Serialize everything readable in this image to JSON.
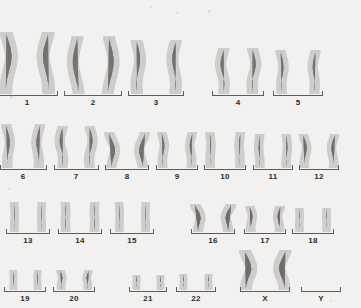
{
  "figure": {
    "kind": "human-karyotype",
    "background_color": "#f2f1ef",
    "stain_color": "#6e6c69",
    "bracket_color": "#5d5d5d",
    "label_color": "#2b2b2b",
    "total_groups": 24,
    "sex_chromosomes_present": [
      "X",
      "X"
    ],
    "width": 361,
    "height": 308
  },
  "rows": [
    {
      "name": "row-1",
      "top": 18,
      "height": 90,
      "groups": [
        {
          "label": "1",
          "x": 27,
          "w": 62,
          "chrom_h": 62,
          "chrom_w": 15,
          "shape": "long-curve-a",
          "count": 2,
          "gap": 4
        },
        {
          "label": "2",
          "x": 93,
          "w": 58,
          "chrom_h": 58,
          "chrom_w": 14,
          "shape": "long-curve-b",
          "count": 2,
          "gap": 6
        },
        {
          "label": "3",
          "x": 156,
          "w": 56,
          "chrom_h": 54,
          "chrom_w": 14,
          "shape": "long-curve-c",
          "count": 2,
          "gap": 5
        },
        {
          "label": "4",
          "x": 238,
          "w": 52,
          "chrom_h": 46,
          "chrom_w": 13,
          "shape": "mid-curve-a",
          "count": 2,
          "gap": 4
        },
        {
          "label": "5",
          "x": 298,
          "w": 50,
          "chrom_h": 44,
          "chrom_w": 12,
          "shape": "mid-curve-b",
          "count": 2,
          "gap": 5
        }
      ]
    },
    {
      "name": "row-2",
      "top": 110,
      "height": 72,
      "groups": [
        {
          "label": "6",
          "x": 23,
          "w": 47,
          "chrom_h": 44,
          "chrom_w": 12,
          "shape": "mid-curve-c",
          "count": 2,
          "gap": 3
        },
        {
          "label": "7",
          "x": 76,
          "w": 45,
          "chrom_h": 42,
          "chrom_w": 12,
          "shape": "mid-curve-a",
          "count": 2,
          "gap": 3
        },
        {
          "label": "8",
          "x": 127,
          "w": 44,
          "chrom_h": 36,
          "chrom_w": 12,
          "shape": "hook-a",
          "count": 2,
          "gap": 3
        },
        {
          "label": "9",
          "x": 177,
          "w": 42,
          "chrom_h": 36,
          "chrom_w": 11,
          "shape": "mid-curve-b",
          "count": 2,
          "gap": 4
        },
        {
          "label": "10",
          "x": 225,
          "w": 42,
          "chrom_h": 36,
          "chrom_w": 11,
          "shape": "slim-a",
          "count": 2,
          "gap": 5
        },
        {
          "label": "11",
          "x": 273,
          "w": 40,
          "chrom_h": 34,
          "chrom_w": 11,
          "shape": "slim-b",
          "count": 2,
          "gap": 4
        },
        {
          "label": "12",
          "x": 319,
          "w": 40,
          "chrom_h": 34,
          "chrom_w": 11,
          "shape": "mid-curve-c",
          "count": 2,
          "gap": 4
        }
      ]
    },
    {
      "name": "row-3",
      "top": 188,
      "height": 58,
      "groups": [
        {
          "label": "13",
          "x": 28,
          "w": 44,
          "chrom_h": 30,
          "chrom_w": 10,
          "shape": "acro-a",
          "count": 2,
          "gap": 6
        },
        {
          "label": "14",
          "x": 80,
          "w": 44,
          "chrom_h": 30,
          "chrom_w": 11,
          "shape": "acro-b",
          "count": 2,
          "gap": 5
        },
        {
          "label": "15",
          "x": 132,
          "w": 44,
          "chrom_h": 30,
          "chrom_w": 10,
          "shape": "acro-a",
          "count": 2,
          "gap": 5
        },
        {
          "label": "16",
          "x": 213,
          "w": 44,
          "chrom_h": 28,
          "chrom_w": 12,
          "shape": "hook-b",
          "count": 2,
          "gap": 3
        },
        {
          "label": "17",
          "x": 265,
          "w": 42,
          "chrom_h": 26,
          "chrom_w": 11,
          "shape": "hook-c",
          "count": 2,
          "gap": 4
        },
        {
          "label": "18",
          "x": 313,
          "w": 42,
          "chrom_h": 24,
          "chrom_w": 10,
          "shape": "short-a",
          "count": 2,
          "gap": 6
        }
      ]
    },
    {
      "name": "row-4",
      "top": 252,
      "height": 52,
      "groups": [
        {
          "label": "19",
          "x": 25,
          "w": 42,
          "chrom_h": 20,
          "chrom_w": 9,
          "shape": "short-b",
          "count": 2,
          "gap": 5
        },
        {
          "label": "20",
          "x": 74,
          "w": 42,
          "chrom_h": 20,
          "chrom_w": 10,
          "shape": "short-c",
          "count": 2,
          "gap": 5
        },
        {
          "label": "21",
          "x": 148,
          "w": 38,
          "chrom_h": 15,
          "chrom_w": 9,
          "shape": "tiny-a",
          "count": 2,
          "gap": 5
        },
        {
          "label": "22",
          "x": 196,
          "w": 40,
          "chrom_h": 16,
          "chrom_w": 9,
          "shape": "tiny-b",
          "count": 2,
          "gap": 6
        },
        {
          "label": "X",
          "x": 265,
          "w": 50,
          "chrom_h": 40,
          "chrom_w": 14,
          "shape": "x-chrom",
          "count": 2,
          "gap": 3
        },
        {
          "label": "Y",
          "x": 321,
          "w": 40,
          "chrom_h": 0,
          "chrom_w": 0,
          "shape": "none",
          "count": 0,
          "gap": 0
        }
      ]
    }
  ]
}
